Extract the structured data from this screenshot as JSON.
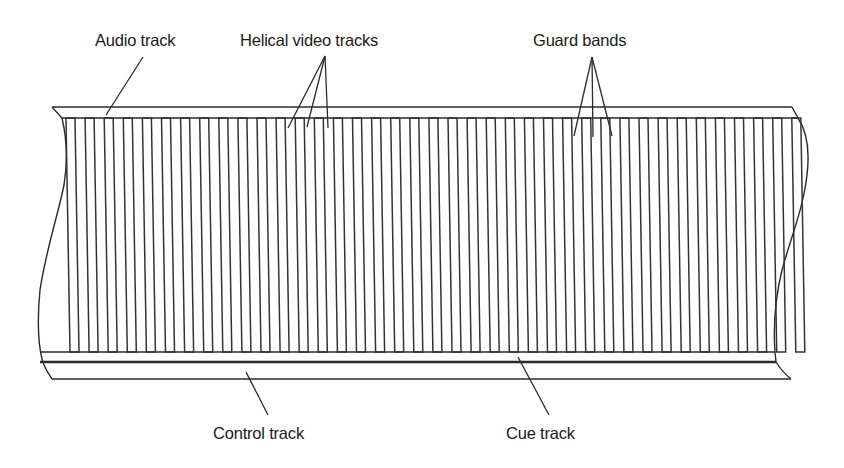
{
  "diagram": {
    "labels": {
      "audio_track": "Audio track",
      "helical_video_tracks": "Helical video tracks",
      "guard_bands": "Guard bands",
      "control_track": "Control track",
      "cue_track": "Cue track"
    },
    "colors": {
      "background": "#ffffff",
      "line": "#2a2a2a",
      "text": "#1a1a1a"
    },
    "tracks": {
      "count": 39,
      "start_x": 66,
      "pitch": 19.1,
      "track_width": 9,
      "slant": 4,
      "top_y": 118,
      "bottom_y": 352
    }
  }
}
